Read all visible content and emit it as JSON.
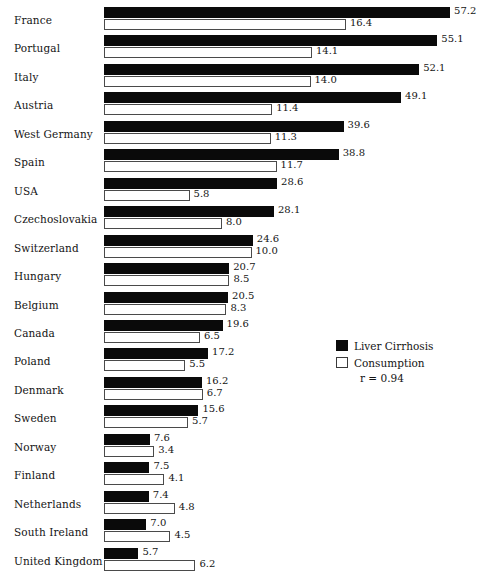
{
  "chart_data": {
    "type": "bar",
    "title": "",
    "subtitle": "",
    "xlabel": "",
    "ylabel": "",
    "orientation": "horizontal",
    "grid": false,
    "legend_position": "middle-right",
    "annotations": [
      "r = 0.94"
    ],
    "categories": [
      "France",
      "Portugal",
      "Italy",
      "Austria",
      "West Germany",
      "Spain",
      "USA",
      "Czechoslovakia",
      "Switzerland",
      "Hungary",
      "Belgium",
      "Canada",
      "Poland",
      "Denmark",
      "Sweden",
      "Norway",
      "Finland",
      "Netherlands",
      "South Ireland",
      "United Kingdom"
    ],
    "series": [
      {
        "name": "Liver Cirrhosis",
        "color": "#0a0a0a",
        "values": [
          57.2,
          55.1,
          52.1,
          49.1,
          39.6,
          38.8,
          28.6,
          28.1,
          24.6,
          20.7,
          20.5,
          19.6,
          17.2,
          16.2,
          15.6,
          7.6,
          7.5,
          7.4,
          7.0,
          5.7
        ]
      },
      {
        "name": "Consumption",
        "color": "#ffffff",
        "values": [
          16.4,
          14.1,
          14.0,
          11.4,
          11.3,
          11.7,
          5.8,
          8.0,
          10.0,
          8.5,
          8.3,
          6.5,
          5.5,
          6.7,
          5.7,
          3.4,
          4.1,
          4.8,
          4.5,
          6.2
        ]
      }
    ]
  },
  "legend": {
    "items": [
      {
        "label": "Liver Cirrhosis",
        "swatch": "filled"
      },
      {
        "label": "Consumption",
        "swatch": "hollow"
      }
    ],
    "correlation": "r = 0.94"
  }
}
